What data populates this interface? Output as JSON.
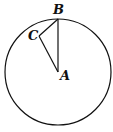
{
  "diagram": {
    "type": "geometry",
    "labels": {
      "A": "A",
      "B": "B",
      "C": "C"
    },
    "circle": {
      "cx": 58,
      "cy": 72,
      "r": 53
    },
    "points": {
      "A": [
        58,
        72
      ],
      "B": [
        58,
        19
      ],
      "C": [
        39,
        36
      ]
    },
    "segments": [
      [
        "A",
        "B"
      ],
      [
        "A",
        "C"
      ],
      [
        "C",
        "B"
      ]
    ],
    "stroke_color": "#111111"
  }
}
